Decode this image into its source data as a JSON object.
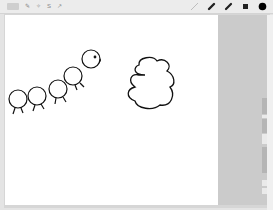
{
  "toolbar": {
    "left_buttons": [
      {
        "name": "gallery",
        "label": "Gallery"
      },
      {
        "name": "wrench",
        "icon": "wrench-icon",
        "glyph": "✎"
      },
      {
        "name": "magic",
        "icon": "magic-wand-icon",
        "glyph": "✧"
      },
      {
        "name": "selection",
        "icon": "selection-icon",
        "glyph": "S"
      },
      {
        "name": "transform",
        "icon": "transform-arrow-icon",
        "glyph": "↗"
      }
    ],
    "right_tools": [
      {
        "name": "brush",
        "icon": "brush-icon",
        "color": "#bdbdbd"
      },
      {
        "name": "smudge",
        "icon": "smudge-icon",
        "color": "#222222"
      },
      {
        "name": "eraser",
        "icon": "eraser-icon",
        "color": "#222222"
      },
      {
        "name": "layers",
        "icon": "layers-icon",
        "color": "#222222"
      },
      {
        "name": "color",
        "icon": "color-swatch",
        "color": "#000000"
      }
    ]
  },
  "canvas": {
    "background": "#ffffff",
    "drawings": [
      "caterpillar",
      "cloud-shape"
    ]
  },
  "sidebar": {
    "sliders": [
      "brush-size-slider",
      "opacity-slider"
    ]
  }
}
